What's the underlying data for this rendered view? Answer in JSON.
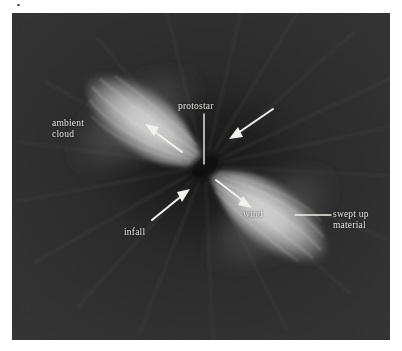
{
  "figure": {
    "panel": {
      "background_color": "#2e2e2e",
      "x": 12,
      "y": 13,
      "width": 378,
      "height": 327
    },
    "colors": {
      "background_dark": "#2e2e2e",
      "background_deep": "#1f1f1f",
      "lobe_bright": "#c9c9c9",
      "lobe_mid": "#9a9a9a",
      "lobe_edge": "#4a4a4a",
      "annotation_light": "#e8e6e2",
      "annotation_dark": "#1a1a1a",
      "page": "#ffffff"
    },
    "center": {
      "x": 205,
      "y": 166,
      "label": "protostar"
    },
    "lobes": [
      {
        "name": "upper-left-lobe",
        "semantic": "ambient cloud outflow lobe",
        "tip_x": 82,
        "tip_y": 82,
        "center_x": 135,
        "center_y": 120,
        "angle_deg": -35,
        "length": 150,
        "width": 62
      },
      {
        "name": "lower-right-lobe",
        "semantic": "wind swept-up lobe",
        "tip_x": 305,
        "tip_y": 248,
        "center_x": 262,
        "center_y": 215,
        "angle_deg": -35,
        "length": 150,
        "width": 62
      }
    ],
    "labels": [
      {
        "id": "ambient-cloud",
        "text": "ambient\ncloud",
        "x": 52,
        "y": 118,
        "color": "light"
      },
      {
        "id": "protostar",
        "text": "protostar",
        "x": 178,
        "y": 101,
        "color": "light"
      },
      {
        "id": "infall",
        "text": "infall",
        "x": 124,
        "y": 227,
        "color": "light"
      },
      {
        "id": "wind",
        "text": "wind",
        "x": 243,
        "y": 209,
        "color": "light"
      },
      {
        "id": "swept-up-material",
        "text": "swept up\nmaterial",
        "x": 333,
        "y": 209,
        "color": "light"
      }
    ],
    "arrows": [
      {
        "id": "ambient-cloud-arrow",
        "x1": 182,
        "y1": 152,
        "x2": 147,
        "y2": 126,
        "semantic": "outflow direction in ambient cloud lobe"
      },
      {
        "id": "infall-upper-right-arrow",
        "x1": 273,
        "y1": 109,
        "x2": 231,
        "y2": 137,
        "semantic": "infalling material from upper right"
      },
      {
        "id": "infall-lower-left-arrow",
        "x1": 152,
        "y1": 220,
        "x2": 187,
        "y2": 190,
        "semantic": "infalling material from lower left"
      },
      {
        "id": "wind-arrow",
        "x1": 216,
        "y1": 180,
        "x2": 249,
        "y2": 206,
        "semantic": "wind direction in outflow lobe"
      }
    ],
    "leader_lines": [
      {
        "id": "protostar-leader",
        "x1": 204,
        "y1": 114,
        "x2": 204,
        "y2": 164,
        "orientation": "vertical"
      },
      {
        "id": "swept-up-material-leader",
        "x1": 295,
        "y1": 215,
        "x2": 331,
        "y2": 215,
        "orientation": "horizontal"
      }
    ]
  }
}
